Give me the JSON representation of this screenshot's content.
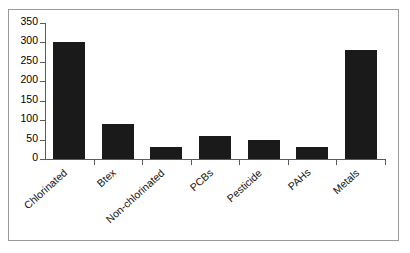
{
  "chart_data": {
    "type": "bar",
    "title": "",
    "subtitle": "",
    "xlabel": "",
    "ylabel": "",
    "categories": [
      "Chlorinated",
      "Btex",
      "Non-chlorinated",
      "PCBs",
      "Pesticide",
      "PAHs",
      "Metals"
    ],
    "values": [
      300,
      90,
      30,
      60,
      50,
      30,
      280
    ],
    "ylim": [
      0,
      350
    ],
    "ytick_labels": [
      "0",
      "50",
      "100",
      "150",
      "200",
      "250",
      "300",
      "350"
    ],
    "ytick_values": [
      0,
      50,
      100,
      150,
      200,
      250,
      300,
      350
    ],
    "grid": false,
    "legend": null,
    "bar_color": "#1a1a1a",
    "axis_color": "#5a5a5a",
    "background_color": "#ffffff",
    "frame_border_color": "#9a9a9a"
  }
}
